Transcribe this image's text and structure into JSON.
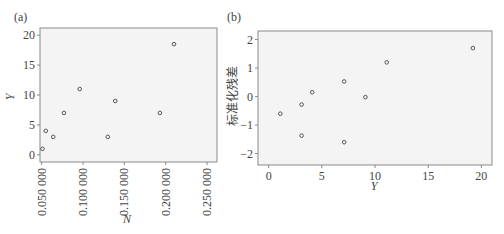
{
  "chart_data": [
    {
      "panel_label": "(a)",
      "type": "scatter",
      "title": "",
      "xlabel": "N",
      "ylabel": "Y",
      "xlim": [
        0.048,
        0.262
      ],
      "ylim": [
        -1.2,
        21.2
      ],
      "xticks": [
        0.05,
        0.1,
        0.15,
        0.2,
        0.25
      ],
      "xtick_labels": [
        "0.050 000",
        "0.100 000",
        "0.150 000",
        "0.200 000",
        "0.250 000"
      ],
      "xtick_rotation": 90,
      "yticks": [
        0,
        5,
        10,
        15,
        20
      ],
      "ytick_labels": [
        "0",
        "5",
        "10",
        "15",
        "20"
      ],
      "grid": false,
      "legend": null,
      "series": [
        {
          "name": "observations",
          "marker": "open-circle",
          "x": [
            0.051,
            0.055,
            0.064,
            0.077,
            0.096,
            0.13,
            0.139,
            0.193,
            0.21
          ],
          "y": [
            1,
            4,
            3,
            7,
            11,
            3,
            9,
            7,
            18.5
          ]
        }
      ]
    },
    {
      "panel_label": "(b)",
      "type": "scatter",
      "title": "",
      "xlabel": "Y",
      "ylabel": "标准化残差",
      "xlim": [
        -1.0,
        21.0
      ],
      "ylim": [
        -2.4,
        2.3
      ],
      "xticks": [
        0,
        5,
        10,
        15,
        20
      ],
      "xtick_labels": [
        "0",
        "5",
        "10",
        "15",
        "20"
      ],
      "yticks": [
        -2,
        -1,
        0,
        1,
        2
      ],
      "ytick_labels": [
        "−2",
        "−1",
        "0",
        "1",
        "2"
      ],
      "grid": false,
      "legend": null,
      "series": [
        {
          "name": "standardized residuals",
          "marker": "open-circle",
          "x": [
            1.1,
            3.1,
            3.1,
            4.1,
            7.1,
            7.1,
            9.1,
            11.1,
            19.2
          ],
          "y": [
            -0.6,
            -0.28,
            -1.37,
            0.15,
            0.53,
            -1.6,
            -0.02,
            1.2,
            1.7
          ]
        }
      ]
    }
  ],
  "style": {
    "plot_background": "#f4f4f4",
    "frame_color": "#8a8a8a",
    "marker_color": "#555555",
    "text_color": "#444444"
  }
}
